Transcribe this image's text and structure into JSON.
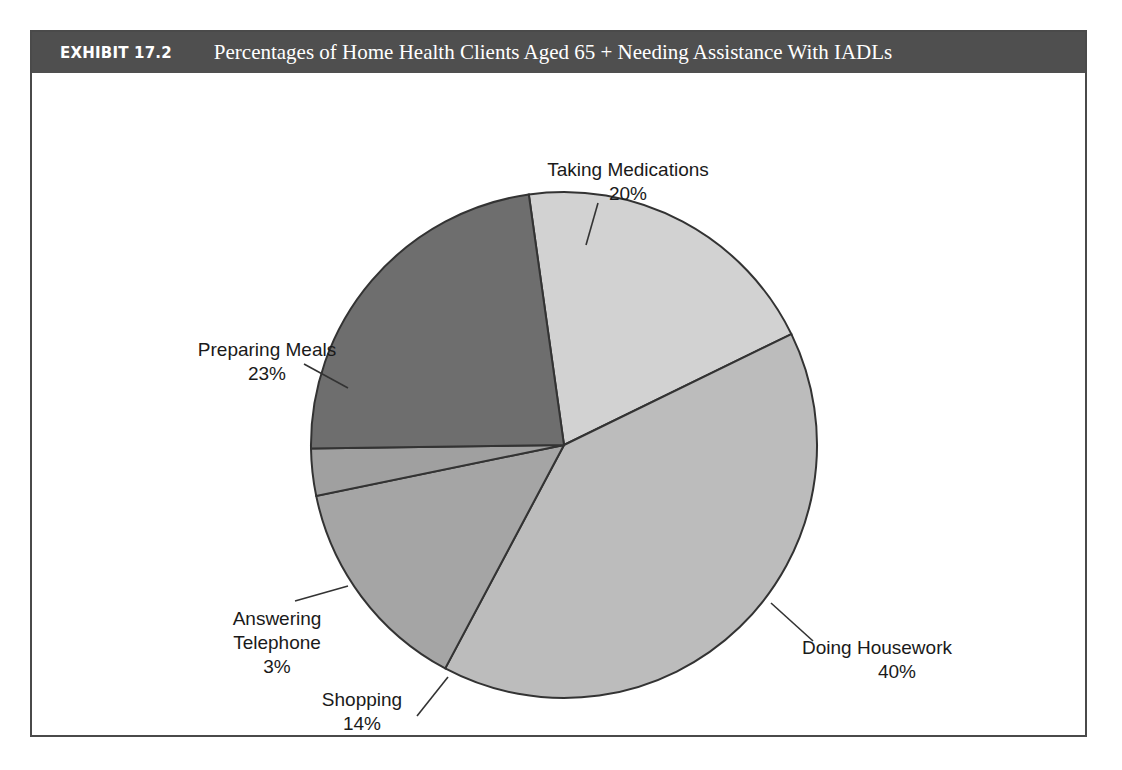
{
  "exhibit": {
    "number": "EXHIBIT 17.2",
    "title": "Percentages of Home Health Clients Aged 65 +  Needing Assistance With IADLs"
  },
  "colors": {
    "header_background": "#4f4f4f",
    "header_text": "#ffffff",
    "frame_border": "#4a4a4a",
    "page_background": "#ffffff",
    "slice_outline": "#333333"
  },
  "chart_data": {
    "type": "pie",
    "title": "Percentages of Home Health Clients Aged 65 + Needing Assistance With IADLs",
    "xlabel": "",
    "ylabel": "",
    "legend_position": "none",
    "labels_outside": true,
    "start_angle_deg": -8,
    "direction": "clockwise",
    "categories": [
      "Taking Medications",
      "Doing Housework",
      "Shopping",
      "Answering Telephone",
      "Preparing Meals"
    ],
    "values": [
      20,
      40,
      14,
      3,
      23
    ],
    "value_labels": [
      "20%",
      "40%",
      "14%",
      "3%",
      "23%"
    ],
    "slice_colors": [
      "#d2d2d2",
      "#bcbcbc",
      "#a5a5a5",
      "#a0a0a0",
      "#6e6e6e"
    ],
    "total": 100,
    "slices": [
      {
        "name": "Taking Medications",
        "value": 20,
        "label": "20%",
        "color": "#d2d2d2"
      },
      {
        "name": "Doing Housework",
        "value": 40,
        "label": "40%",
        "color": "#bcbcbc"
      },
      {
        "name": "Shopping",
        "value": 14,
        "label": "14%",
        "color": "#a5a5a5"
      },
      {
        "name": "Answering Telephone",
        "value": 3,
        "label": "3%",
        "color": "#a0a0a0"
      },
      {
        "name": "Preparing Meals",
        "value": 23,
        "label": "23%",
        "color": "#6e6e6e"
      }
    ]
  },
  "labels": {
    "taking_medications": {
      "name": "Taking Medications",
      "value": "20%"
    },
    "doing_housework": {
      "name": "Doing Housework",
      "value": "40%"
    },
    "shopping": {
      "name": "Shopping",
      "value": "14%"
    },
    "answering_telephone": {
      "name_line1": "Answering",
      "name_line2": "Telephone",
      "value": "3%"
    },
    "preparing_meals": {
      "name": "Preparing Meals",
      "value": "23%"
    }
  }
}
